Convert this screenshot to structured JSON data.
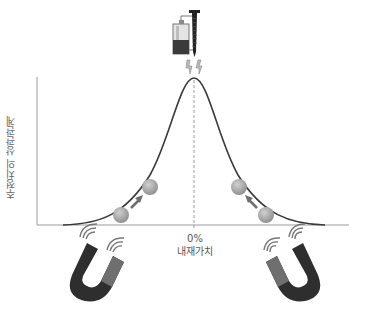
{
  "diagram": {
    "y_axis_label": "추정치의 상관관계",
    "x_axis_tick": "0%",
    "x_axis_label": "내재가치",
    "icons": {
      "top": "battery-nail-electromagnet-icon",
      "left_bottom": "horseshoe-magnet-icon",
      "right_bottom": "horseshoe-magnet-icon"
    },
    "colors": {
      "curve": "#3a3a3a",
      "axis": "#9a9a9a",
      "ball": "#a8a8a8",
      "arrow": "#6e6e6e",
      "magnet_dark": "#2a2a2a",
      "magnet_light": "#7a7a7a"
    }
  }
}
